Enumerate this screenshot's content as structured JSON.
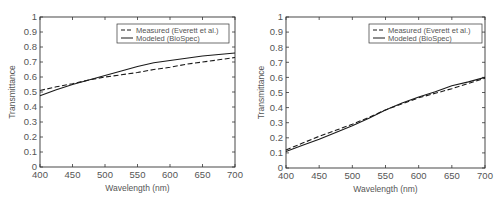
{
  "chart_data": [
    {
      "type": "line",
      "title": "",
      "xlabel": "Wavelength (nm)",
      "ylabel": "Transmittance",
      "xlim": [
        400,
        700
      ],
      "ylim": [
        0,
        1
      ],
      "xticks": [
        400,
        450,
        500,
        550,
        600,
        650,
        700
      ],
      "yticks": [
        0,
        0.1,
        0.2,
        0.3,
        0.4,
        0.5,
        0.6,
        0.7,
        0.8,
        0.9,
        1
      ],
      "ytick_labels": [
        "0",
        "0.1",
        "0.2",
        "0.3",
        "0.4",
        "0.5",
        "0.6",
        "0.7",
        "0.8",
        "0.9",
        "1"
      ],
      "grid": false,
      "legend_position": "upper right",
      "x": [
        400,
        425,
        450,
        475,
        500,
        525,
        550,
        575,
        600,
        625,
        650,
        675,
        700
      ],
      "series": [
        {
          "name": "Measured (Everett et al.)",
          "style": "dashed",
          "values": [
            0.51,
            0.535,
            0.555,
            0.58,
            0.6,
            0.615,
            0.63,
            0.65,
            0.665,
            0.685,
            0.7,
            0.715,
            0.73
          ]
        },
        {
          "name": "Modeled (BioSpec)",
          "style": "solid",
          "values": [
            0.475,
            0.515,
            0.55,
            0.58,
            0.61,
            0.64,
            0.67,
            0.695,
            0.71,
            0.725,
            0.74,
            0.75,
            0.76
          ]
        }
      ]
    },
    {
      "type": "line",
      "title": "",
      "xlabel": "Wavelength (nm)",
      "ylabel": "Transmittance",
      "xlim": [
        400,
        700
      ],
      "ylim": [
        0,
        1
      ],
      "xticks": [
        400,
        450,
        500,
        550,
        600,
        650,
        700
      ],
      "yticks": [
        0,
        0.1,
        0.2,
        0.3,
        0.4,
        0.5,
        0.6,
        0.7,
        0.8,
        0.9,
        1
      ],
      "ytick_labels": [
        "0",
        "0.1",
        "0.2",
        "0.3",
        "0.4",
        "0.5",
        "0.6",
        "0.7",
        "0.8",
        "0.9",
        "1"
      ],
      "grid": false,
      "legend_position": "upper right",
      "x": [
        400,
        425,
        450,
        475,
        500,
        525,
        550,
        575,
        600,
        625,
        650,
        675,
        700
      ],
      "series": [
        {
          "name": "Measured (Everett et al.)",
          "style": "dashed",
          "values": [
            0.12,
            0.165,
            0.21,
            0.25,
            0.29,
            0.335,
            0.385,
            0.425,
            0.465,
            0.495,
            0.525,
            0.56,
            0.595
          ]
        },
        {
          "name": "Modeled (BioSpec)",
          "style": "solid",
          "values": [
            0.11,
            0.15,
            0.19,
            0.235,
            0.28,
            0.33,
            0.385,
            0.43,
            0.47,
            0.505,
            0.545,
            0.57,
            0.6
          ]
        }
      ]
    }
  ],
  "legend": {
    "measured_label": "Measured (Everett et al.)",
    "modeled_label": "Modeled (BioSpec)"
  },
  "colors": {
    "line": "#1a1a1a",
    "axis": "#333333",
    "text": "#555555"
  }
}
